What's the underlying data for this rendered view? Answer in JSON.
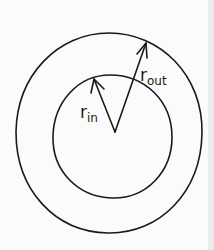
{
  "diagram": {
    "type": "concentric-circles-annulus",
    "stroke_color": "#1a1a1a",
    "background_color": "#fbfbfb",
    "labels": {
      "outer_radius": {
        "base": "r",
        "subscript": "out"
      },
      "inner_radius": {
        "base": "r",
        "subscript": "in"
      }
    },
    "shapes": {
      "outer_circle": {
        "cx": 109,
        "cy": 133,
        "rx": 93,
        "ry": 100
      },
      "inner_circle": {
        "cx": 112,
        "cy": 137,
        "rx": 60,
        "ry": 62
      },
      "center": {
        "x": 115,
        "y": 132
      },
      "inner_arrow_tip": {
        "x": 94,
        "y": 79
      },
      "outer_arrow_tip": {
        "x": 146,
        "y": 43
      }
    }
  }
}
